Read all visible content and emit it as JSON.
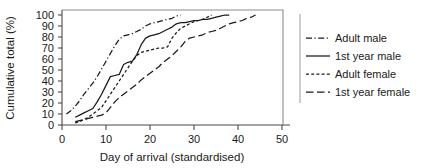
{
  "chart_data": {
    "type": "line",
    "title": "",
    "xlabel": "Day of arrival (standardised)",
    "ylabel": "Cumulative total (%)",
    "xlim": [
      0,
      50
    ],
    "ylim": [
      0,
      100
    ],
    "xticks": [
      0,
      10,
      20,
      30,
      40,
      50
    ],
    "yticks": [
      0,
      10,
      20,
      30,
      40,
      50,
      60,
      70,
      80,
      90,
      100
    ],
    "grid": false,
    "legend_position": "right",
    "series": [
      {
        "name": "Adult male",
        "style": "dash-dot",
        "x": [
          1,
          2,
          3,
          4,
          5,
          6,
          7,
          8,
          9,
          10,
          11,
          12,
          13,
          14,
          15,
          16,
          17,
          18,
          19,
          20,
          21,
          22,
          23,
          24,
          25,
          26,
          27
        ],
        "y": [
          10,
          13,
          17,
          22,
          28,
          33,
          38,
          44,
          51,
          58,
          65,
          72,
          78,
          81,
          82,
          83,
          85,
          87,
          90,
          92,
          93,
          94,
          95,
          96,
          97,
          99,
          100
        ]
      },
      {
        "name": "1st year male",
        "style": "solid",
        "x": [
          3,
          4,
          5,
          6,
          7,
          8,
          9,
          10,
          11,
          12,
          13,
          14,
          15,
          16,
          17,
          18,
          19,
          20,
          21,
          22,
          23,
          24,
          25,
          26,
          27,
          28,
          29,
          30,
          31,
          32,
          33,
          34,
          35,
          36,
          37,
          38
        ],
        "y": [
          7,
          9,
          11,
          13,
          15,
          21,
          28,
          36,
          44,
          45,
          46,
          55,
          57,
          58,
          64,
          73,
          79,
          81,
          82,
          83,
          85,
          87,
          89,
          92,
          93,
          93,
          94,
          95,
          95,
          96,
          96,
          97,
          98,
          99,
          100,
          100
        ]
      },
      {
        "name": "Adult female",
        "style": "short-dash",
        "x": [
          3,
          4,
          5,
          6,
          7,
          8,
          9,
          10,
          11,
          12,
          13,
          14,
          15,
          16,
          17,
          18,
          19,
          20,
          21,
          22,
          23,
          24,
          25,
          26,
          27,
          28,
          29,
          30,
          31,
          32,
          33,
          34
        ],
        "y": [
          2,
          3,
          5,
          7,
          10,
          13,
          16,
          22,
          28,
          34,
          40,
          46,
          52,
          58,
          63,
          66,
          67,
          68,
          69,
          70,
          70,
          71,
          79,
          84,
          88,
          90,
          92,
          94,
          95,
          96,
          98,
          100
        ]
      },
      {
        "name": "1st year female",
        "style": "long-dash",
        "x": [
          3,
          4,
          5,
          6,
          7,
          8,
          9,
          10,
          11,
          12,
          13,
          14,
          15,
          16,
          17,
          18,
          19,
          20,
          21,
          22,
          23,
          24,
          25,
          26,
          27,
          28,
          29,
          30,
          31,
          32,
          33,
          34,
          35,
          36,
          37,
          38,
          39,
          40,
          41,
          42,
          43,
          44
        ],
        "y": [
          3,
          4,
          5,
          6,
          7,
          8,
          9,
          11,
          16,
          21,
          25,
          28,
          31,
          34,
          37,
          41,
          44,
          47,
          50,
          53,
          57,
          60,
          63,
          67,
          71,
          76,
          79,
          80,
          81,
          82,
          84,
          85,
          86,
          88,
          90,
          92,
          93,
          94,
          95,
          97,
          98,
          100
        ]
      }
    ],
    "tick_labels_x": [
      "0",
      "10",
      "20",
      "30",
      "40",
      "50"
    ],
    "tick_labels_y": [
      "0",
      "10",
      "20",
      "30",
      "40",
      "50",
      "60",
      "70",
      "80",
      "90",
      "100"
    ]
  },
  "legend": {
    "items": [
      {
        "label": "Adult male",
        "style": "dash-dot"
      },
      {
        "label": "1st year male",
        "style": "solid"
      },
      {
        "label": "Adult female",
        "style": "short-dash"
      },
      {
        "label": "1st year female",
        "style": "long-dash"
      }
    ]
  },
  "colors": {
    "ink": "#1a1a1a",
    "axis": "#4a4a4a",
    "frame": "#8c8c8c",
    "background": "#ffffff"
  }
}
